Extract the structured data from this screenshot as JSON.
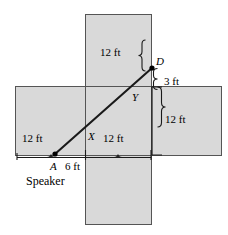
{
  "figure": {
    "colors": {
      "fill": "#d9d9d9",
      "stroke": "#555555",
      "line": "#1a1a1a",
      "text": "#000000",
      "background": "#ffffff"
    },
    "shape": {
      "description": "cross / plus-shaped polygon net of a room",
      "vertical_band": {
        "x": 85,
        "y": 14,
        "width": 67,
        "height": 211
      },
      "horizontal_band": {
        "x": 15,
        "y": 86,
        "width": 207,
        "height": 70
      }
    },
    "points": [
      {
        "name": "A",
        "label": "A",
        "x": 55,
        "y": 154,
        "dot": true
      },
      {
        "name": "X",
        "label": "X",
        "x": 86,
        "y": 128,
        "dot": false
      },
      {
        "name": "Y",
        "label": "Y",
        "x": 137,
        "y": 86,
        "dot": false
      },
      {
        "name": "D",
        "label": "D",
        "x": 152,
        "y": 68,
        "dot": true
      }
    ],
    "dimensions": [
      {
        "name": "top-12ft",
        "label": "12 ft",
        "x": 114,
        "y": 53
      },
      {
        "name": "right-3ft",
        "label": "3 ft",
        "x": 170,
        "y": 82
      },
      {
        "name": "right-12ft",
        "label": "12 ft",
        "x": 167,
        "y": 121
      },
      {
        "name": "bottom-left-12ft",
        "label": "12 ft",
        "x": 33,
        "y": 139
      },
      {
        "name": "bottom-right-12ft",
        "label": "12 ft",
        "x": 102,
        "y": 139
      },
      {
        "name": "a-offset-6ft",
        "label": "6 ft",
        "x": 72,
        "y": 165
      }
    ],
    "annotations": [
      {
        "name": "speaker-label",
        "label": "Speaker",
        "x": 27,
        "y": 180
      }
    ]
  }
}
